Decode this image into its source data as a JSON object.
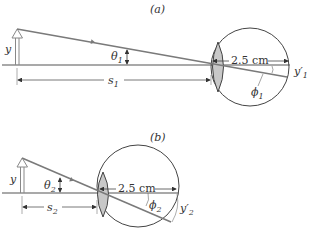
{
  "parts": [
    {
      "label": "(a)",
      "object_label": "y",
      "angle_label": "θ",
      "angle_sub": "1",
      "distance_label": "s",
      "distance_sub": "1",
      "eye_length": "2.5 cm",
      "image_angle_label": "ϕ",
      "image_angle_sub": "1",
      "image_label": "y′",
      "image_sub": "1"
    },
    {
      "label": "(b)",
      "object_label": "y",
      "angle_label": "θ",
      "angle_sub": "2",
      "distance_label": "s",
      "distance_sub": "2",
      "eye_length": "2.5 cm",
      "image_angle_label": "ϕ",
      "image_angle_sub": "2",
      "image_label": "y′",
      "image_sub": "2"
    }
  ],
  "colors": {
    "ray": "#7a7a7a",
    "axis": "#555555",
    "lens_fill": "#c8c8c8",
    "outline": "#444444"
  }
}
